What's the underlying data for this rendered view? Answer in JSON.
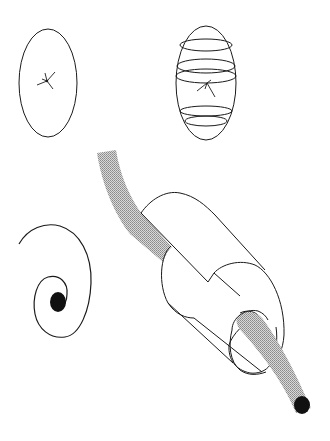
{
  "diagram": {
    "background": "#ffffff",
    "stroke_color": "#1a1a1a",
    "fill_dark": "#111111",
    "fill_gray": "#b8b8b8",
    "figures": [
      {
        "id": "plain-ellipse",
        "description": "Ellipse with small star burst at center"
      },
      {
        "id": "banded-ellipse",
        "description": "Ellipse with horizontal ring bands and star burst"
      },
      {
        "id": "spiral",
        "description": "Spiral curve ending in a filled dot"
      },
      {
        "id": "split-cylinder",
        "description": "Cut-away cylinder with gray tube passing through, ending in a filled dot"
      }
    ]
  }
}
